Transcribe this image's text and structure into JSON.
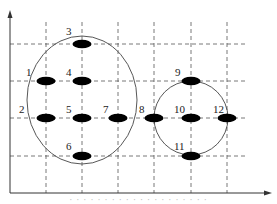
{
  "diagram": {
    "axes": {
      "origin": [
        10,
        193
      ],
      "x_end": 270,
      "y_end": 12
    },
    "grid": {
      "vertical_x": [
        46,
        82,
        118,
        154,
        191,
        227
      ],
      "horizontal_y": [
        44,
        81,
        118,
        156
      ]
    },
    "groups": [
      {
        "name": "large-cluster",
        "cx": 82,
        "cy": 100,
        "rx": 55,
        "ry": 64
      },
      {
        "name": "small-cluster",
        "cx": 191,
        "cy": 118,
        "rx": 37,
        "ry": 37
      }
    ],
    "nodes": [
      {
        "id": "1",
        "x": 46,
        "y": 81,
        "lx": 26,
        "ly": 76
      },
      {
        "id": "2",
        "x": 46,
        "y": 118,
        "lx": 19,
        "ly": 113
      },
      {
        "id": "3",
        "x": 82,
        "y": 44,
        "lx": 66,
        "ly": 35
      },
      {
        "id": "4",
        "x": 82,
        "y": 81,
        "lx": 66,
        "ly": 76
      },
      {
        "id": "5",
        "x": 82,
        "y": 118,
        "lx": 66,
        "ly": 113
      },
      {
        "id": "6",
        "x": 82,
        "y": 156,
        "lx": 66,
        "ly": 150
      },
      {
        "id": "7",
        "x": 118,
        "y": 118,
        "lx": 103,
        "ly": 113
      },
      {
        "id": "8",
        "x": 154,
        "y": 118,
        "lx": 139,
        "ly": 113
      },
      {
        "id": "9",
        "x": 191,
        "y": 81,
        "lx": 175,
        "ly": 76
      },
      {
        "id": "10",
        "x": 191,
        "y": 118,
        "lx": 174,
        "ly": 113
      },
      {
        "id": "11",
        "x": 191,
        "y": 156,
        "lx": 174,
        "ly": 150
      },
      {
        "id": "12",
        "x": 227,
        "y": 118,
        "lx": 213,
        "ly": 113
      }
    ],
    "node_color": "#000000",
    "line_color": "#555555"
  },
  "caption": "· · · · · · · · · · · · · · · · · · · ·"
}
